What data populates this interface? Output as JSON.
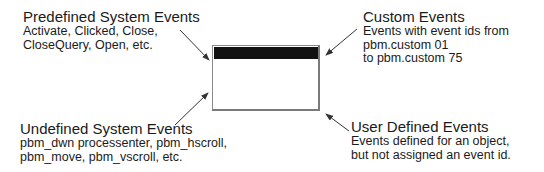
{
  "diagram": {
    "center_object": "window",
    "labels": [
      {
        "id": "predefined",
        "title": "Predefined System Events",
        "lines": [
          "Activate, Clicked, Close,",
          "CloseQuery, Open, etc."
        ]
      },
      {
        "id": "custom",
        "title": "Custom Events",
        "lines": [
          "Events with event ids from",
          "pbm.custom 01",
          "to pbm.custom 75"
        ]
      },
      {
        "id": "undefined",
        "title": "Undefined System Events",
        "lines": [
          "pbm_dwn processenter, pbm_hscroll,",
          "pbm_move, pbm_vscroll, etc."
        ]
      },
      {
        "id": "user",
        "title": "User Defined Events",
        "lines": [
          "Events defined for an object,",
          "but not assigned an event id."
        ]
      }
    ],
    "colors": {
      "text": "#1a1a1a",
      "titlebar": "#121212",
      "window_border": "#8c8c8c",
      "arrow": "#333333"
    }
  }
}
